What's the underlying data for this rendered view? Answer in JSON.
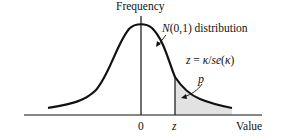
{
  "diagram": {
    "y_axis_label": "Frequency",
    "x_axis_label": "Value",
    "x_ticks": {
      "zero": "0",
      "z": "z"
    },
    "curve_label": {
      "n": "N",
      "params": "(0,1)",
      "rest": " distribution"
    },
    "formula": {
      "lhs": "z",
      "eq": " = ",
      "kappa1": "κ",
      "slash": "/",
      "se": "se",
      "open": "(",
      "kappa2": "κ",
      "close": ")"
    },
    "shaded_label": "p",
    "colors": {
      "curve": "#111111",
      "shade": "#e2e2e2",
      "axis": "#111111"
    }
  }
}
